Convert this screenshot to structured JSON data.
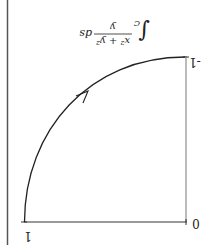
{
  "diagram": {
    "orientation": "rotated 180 degrees",
    "formula": {
      "integral": "∫",
      "subscript": "C",
      "numerator": "x² + y²",
      "denominator": "y",
      "differential": "ds"
    },
    "labels": {
      "origin": "0",
      "x_end": "1",
      "y_end": "-1"
    },
    "curve": {
      "description": "quarter-circle arc from (1,0) to (0,-1), oriented with arrow",
      "stroke": "#222222"
    },
    "border_color": "#555555"
  }
}
